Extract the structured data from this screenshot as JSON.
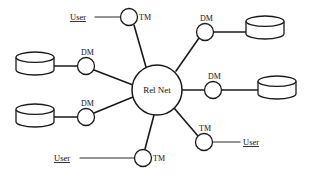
{
  "diagram": {
    "type": "network-topology",
    "hub": {
      "id": "rel-net",
      "label": "Rel Net",
      "shape": "circle",
      "cx": 157,
      "cy": 90,
      "r": 25
    },
    "nodes": [
      {
        "id": "tm-top-left",
        "label": "TM",
        "kind": "transaction-manager",
        "shape": "circle",
        "cx": 129,
        "cy": 17,
        "r": 8.5,
        "label_dx": 10,
        "label_dy": 3
      },
      {
        "id": "dm-top-right",
        "label": "DM",
        "kind": "data-manager",
        "shape": "circle",
        "cx": 205,
        "cy": 32,
        "r": 8.5,
        "label_dx": -5,
        "label_dy": -11
      },
      {
        "id": "dm-left-upper",
        "label": "DM",
        "kind": "data-manager",
        "shape": "circle",
        "cx": 86,
        "cy": 66,
        "r": 8.5,
        "label_dx": -5,
        "label_dy": -11
      },
      {
        "id": "dm-right",
        "label": "DM",
        "kind": "data-manager",
        "shape": "circle",
        "cx": 213,
        "cy": 90,
        "r": 8.5,
        "label_dx": -5,
        "label_dy": -11
      },
      {
        "id": "dm-left-lower",
        "label": "DM",
        "kind": "data-manager",
        "shape": "circle",
        "cx": 86,
        "cy": 117,
        "r": 8.5,
        "label_dx": -5,
        "label_dy": -11
      },
      {
        "id": "tm-bottom-right",
        "label": "TM",
        "kind": "transaction-manager",
        "shape": "circle",
        "cx": 204,
        "cy": 142,
        "r": 8.5,
        "label_dx": -5,
        "label_dy": -11
      },
      {
        "id": "tm-bottom-left",
        "label": "TM",
        "kind": "transaction-manager",
        "shape": "circle",
        "cx": 143,
        "cy": 158,
        "r": 8.5,
        "label_dx": 10,
        "label_dy": 3
      }
    ],
    "databases": [
      {
        "id": "db-top-right",
        "shape": "cylinder",
        "x": 246,
        "y": 16,
        "w": 38,
        "h": 23,
        "attached_to": "dm-top-right"
      },
      {
        "id": "db-left-upper",
        "shape": "cylinder",
        "x": 16,
        "y": 52,
        "w": 38,
        "h": 23,
        "attached_to": "dm-left-upper"
      },
      {
        "id": "db-right",
        "shape": "cylinder",
        "x": 258,
        "y": 76,
        "w": 38,
        "h": 23,
        "attached_to": "dm-right"
      },
      {
        "id": "db-left-lower",
        "shape": "cylinder",
        "x": 16,
        "y": 104,
        "w": 38,
        "h": 23,
        "attached_to": "dm-left-lower"
      }
    ],
    "users": [
      {
        "id": "user-top-left",
        "label": "User",
        "x": 70,
        "y": 20,
        "attached_to": "tm-top-left",
        "line_x1": 95,
        "line_y1": 17,
        "line_x2": 120,
        "line_y2": 17
      },
      {
        "id": "user-bottom-right",
        "label": "User",
        "x": 243,
        "y": 145,
        "attached_to": "tm-bottom-right",
        "line_x1": 213,
        "line_y1": 142,
        "line_x2": 240,
        "line_y2": 142
      },
      {
        "id": "user-bottom-left",
        "label": "User",
        "x": 54,
        "y": 161,
        "attached_to": "tm-bottom-left",
        "line_x1": 80,
        "line_y1": 158,
        "line_x2": 134,
        "line_y2": 158
      }
    ],
    "spokes": [
      {
        "id": "spoke-tm-top-left",
        "x1": 134,
        "y1": 25,
        "x2": 146,
        "y2": 67
      },
      {
        "id": "spoke-dm-top-right",
        "x1": 199,
        "y1": 38,
        "x2": 176,
        "y2": 71
      },
      {
        "id": "spoke-dm-left-upper",
        "x1": 94,
        "y1": 70,
        "x2": 133,
        "y2": 85
      },
      {
        "id": "spoke-dm-right",
        "x1": 204,
        "y1": 90,
        "x2": 182,
        "y2": 90
      },
      {
        "id": "spoke-dm-left-lower",
        "x1": 94,
        "y1": 113,
        "x2": 133,
        "y2": 97
      },
      {
        "id": "spoke-tm-bottom-right",
        "x1": 198,
        "y1": 136,
        "x2": 174,
        "y2": 108
      },
      {
        "id": "spoke-tm-bottom-left",
        "x1": 145,
        "y1": 149,
        "x2": 154,
        "y2": 115
      }
    ],
    "db_links": [
      {
        "id": "link-db-top-right",
        "x1": 213,
        "y1": 32,
        "x2": 249,
        "y2": 32
      },
      {
        "id": "link-db-left-upper",
        "x1": 52,
        "y1": 66,
        "x2": 78,
        "y2": 66
      },
      {
        "id": "link-db-right",
        "x1": 221,
        "y1": 90,
        "x2": 261,
        "y2": 90
      },
      {
        "id": "link-db-left-lower",
        "x1": 52,
        "y1": 117,
        "x2": 78,
        "y2": 117
      }
    ],
    "colors": {
      "stroke": "#1a1a1a",
      "background": "#ffffff",
      "text": "#111111"
    }
  }
}
